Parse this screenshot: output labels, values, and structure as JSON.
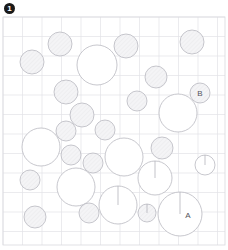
{
  "panel": {
    "marker_label": "1",
    "marker_color": "#1a1a1a"
  },
  "plot": {
    "x": 3,
    "y": 17,
    "width": 222,
    "height": 228,
    "grid_spacing": 19.5,
    "grid_color": "#e2e2e6",
    "border_color": "#d9d9de",
    "background_color": "#ffffff"
  },
  "style": {
    "bubble_fill": "#ffffff",
    "bubble_stroke": "#b9b9c0",
    "bubble_shaded_fill": "#f2f2f4",
    "radius_line_color": "#a9a9b2",
    "label_color": "#55555c"
  },
  "chart_data": {
    "type": "scatter",
    "title": "",
    "xlabel": "",
    "ylabel": "",
    "xlim": [
      3,
      225
    ],
    "ylim": [
      17,
      245
    ],
    "grid": true,
    "legend": null,
    "annotations": [
      "A",
      "B"
    ],
    "series": [
      {
        "name": "bubbles",
        "note": "Circles (bubbles) plotted on a square grid; cx/cy in pixel coordinates, r = radius in pixels. 'shaded' bubbles carry a faint texture fill; 'radius_line' bubbles are drawn with a vertical radius segment from center to top of circle; 'label' marks the two annotated bubbles A and B.",
        "points": [
          {
            "cx": 32,
            "cy": 62,
            "r": 12,
            "shaded": true,
            "radius_line": false,
            "label": ""
          },
          {
            "cx": 60,
            "cy": 44,
            "r": 12,
            "shaded": true,
            "radius_line": false,
            "label": ""
          },
          {
            "cx": 97,
            "cy": 65,
            "r": 20,
            "shaded": false,
            "radius_line": false,
            "label": ""
          },
          {
            "cx": 126,
            "cy": 46,
            "r": 12,
            "shaded": true,
            "radius_line": false,
            "label": ""
          },
          {
            "cx": 192,
            "cy": 42,
            "r": 12,
            "shaded": true,
            "radius_line": false,
            "label": ""
          },
          {
            "cx": 156,
            "cy": 77,
            "r": 11,
            "shaded": true,
            "radius_line": false,
            "label": ""
          },
          {
            "cx": 66,
            "cy": 92,
            "r": 12,
            "shaded": true,
            "radius_line": false,
            "label": ""
          },
          {
            "cx": 137,
            "cy": 101,
            "r": 10,
            "shaded": true,
            "radius_line": false,
            "label": ""
          },
          {
            "cx": 200,
            "cy": 93,
            "r": 10,
            "shaded": true,
            "radius_line": false,
            "label": "B"
          },
          {
            "cx": 178,
            "cy": 113,
            "r": 19,
            "shaded": false,
            "radius_line": false,
            "label": ""
          },
          {
            "cx": 82,
            "cy": 115,
            "r": 12,
            "shaded": true,
            "radius_line": false,
            "label": ""
          },
          {
            "cx": 66,
            "cy": 131,
            "r": 10,
            "shaded": true,
            "radius_line": false,
            "label": ""
          },
          {
            "cx": 41,
            "cy": 147,
            "r": 19,
            "shaded": false,
            "radius_line": false,
            "label": ""
          },
          {
            "cx": 105,
            "cy": 130,
            "r": 10,
            "shaded": true,
            "radius_line": false,
            "label": ""
          },
          {
            "cx": 124,
            "cy": 157,
            "r": 19,
            "shaded": false,
            "radius_line": false,
            "label": ""
          },
          {
            "cx": 71,
            "cy": 155,
            "r": 10,
            "shaded": true,
            "radius_line": false,
            "label": ""
          },
          {
            "cx": 93,
            "cy": 163,
            "r": 10,
            "shaded": true,
            "radius_line": false,
            "label": ""
          },
          {
            "cx": 30,
            "cy": 180,
            "r": 10,
            "shaded": true,
            "radius_line": false,
            "label": ""
          },
          {
            "cx": 76,
            "cy": 187,
            "r": 19,
            "shaded": false,
            "radius_line": false,
            "label": ""
          },
          {
            "cx": 162,
            "cy": 148,
            "r": 11,
            "shaded": true,
            "radius_line": false,
            "label": ""
          },
          {
            "cx": 155,
            "cy": 178,
            "r": 17,
            "shaded": false,
            "radius_line": true,
            "label": ""
          },
          {
            "cx": 205,
            "cy": 165,
            "r": 10,
            "shaded": false,
            "radius_line": true,
            "label": ""
          },
          {
            "cx": 118,
            "cy": 205,
            "r": 19,
            "shaded": false,
            "radius_line": true,
            "label": ""
          },
          {
            "cx": 147,
            "cy": 213,
            "r": 9,
            "shaded": true,
            "radius_line": true,
            "label": ""
          },
          {
            "cx": 180,
            "cy": 214,
            "r": 22,
            "shaded": false,
            "radius_line": true,
            "label": "A"
          },
          {
            "cx": 89,
            "cy": 213,
            "r": 10,
            "shaded": true,
            "radius_line": false,
            "label": ""
          },
          {
            "cx": 35,
            "cy": 217,
            "r": 11,
            "shaded": true,
            "radius_line": false,
            "label": ""
          }
        ]
      }
    ]
  }
}
